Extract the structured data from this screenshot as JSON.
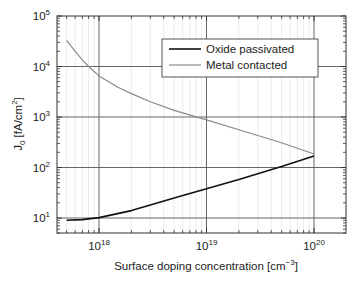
{
  "chart_data": {
    "type": "line",
    "title": "",
    "xlabel": "Surface doping concentration [cm⁻³]",
    "xlabel_base": "Surface doping concentration [cm",
    "xlabel_sup": "−3",
    "xlabel_tail": "]",
    "ylabel": "J0 [fA/cm2]",
    "ylabel_main": "J",
    "ylabel_sub": "0",
    "ylabel_mid": " [fA/cm",
    "ylabel_sup": "2",
    "ylabel_tail": "]",
    "xscale": "log",
    "yscale": "log",
    "xlim": [
      4e+17,
      1.5e+20
    ],
    "ylim": [
      5,
      100000
    ],
    "grid": true,
    "legend_position": "upper right (inside)",
    "x_ticks": [
      {
        "value": 1e+18,
        "base": "10",
        "exp": "18"
      },
      {
        "value": 1e+19,
        "base": "10",
        "exp": "19"
      },
      {
        "value": 1e+20,
        "base": "10",
        "exp": "20"
      }
    ],
    "y_ticks": [
      {
        "value": 10,
        "base": "10",
        "exp": "1"
      },
      {
        "value": 100,
        "base": "10",
        "exp": "2"
      },
      {
        "value": 1000,
        "base": "10",
        "exp": "3"
      },
      {
        "value": 10000,
        "base": "10",
        "exp": "4"
      },
      {
        "value": 100000,
        "base": "10",
        "exp": "5"
      }
    ],
    "series": [
      {
        "name": "Oxide passivated",
        "color": "#111111",
        "width": 1.6,
        "x": [
          5e+17,
          7e+17,
          1e+18,
          2e+18,
          3e+18,
          5e+18,
          1e+19,
          2e+19,
          3e+19,
          5e+19,
          1e+20
        ],
        "y": [
          9,
          9.3,
          10.2,
          14,
          18,
          25,
          38,
          58,
          75,
          105,
          170
        ]
      },
      {
        "name": "Metal contacted",
        "color": "#8a8a8a",
        "width": 1.2,
        "x": [
          5e+17,
          6e+17,
          7e+17,
          8e+17,
          1e+18,
          1.5e+18,
          2e+18,
          3e+18,
          5e+18,
          1e+19,
          2e+19,
          3e+19,
          5e+19,
          1e+20
        ],
        "y": [
          33000,
          20000,
          13500,
          10000,
          6500,
          3900,
          2900,
          2000,
          1350,
          880,
          560,
          430,
          310,
          185
        ]
      }
    ]
  },
  "legend": {
    "items": [
      {
        "label": "Oxide passivated",
        "color": "#111111"
      },
      {
        "label": "Metal contacted",
        "color": "#8a8a8a"
      }
    ]
  }
}
